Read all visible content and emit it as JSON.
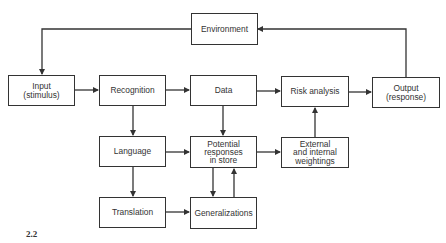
{
  "diagram": {
    "figure_label": "2.2",
    "nodes": {
      "environment": "Environment",
      "input": "Input\n(stimulus)",
      "recognition": "Recognition",
      "data": "Data",
      "risk_analysis": "Risk analysis",
      "output": "Output\n(response)",
      "language": "Language",
      "potential": "Potential\nresponses\nin store",
      "weightings": "External\nand internal\nweightings",
      "translation": "Translation",
      "generalizations": "Generalizations"
    },
    "edges": [
      {
        "from": "environment",
        "to": "input"
      },
      {
        "from": "input",
        "to": "recognition"
      },
      {
        "from": "recognition",
        "to": "data"
      },
      {
        "from": "data",
        "to": "risk_analysis"
      },
      {
        "from": "risk_analysis",
        "to": "output"
      },
      {
        "from": "output",
        "to": "environment"
      },
      {
        "from": "recognition",
        "to": "language"
      },
      {
        "from": "data",
        "to": "potential"
      },
      {
        "from": "language",
        "to": "potential"
      },
      {
        "from": "potential",
        "to": "weightings"
      },
      {
        "from": "weightings",
        "to": "risk_analysis"
      },
      {
        "from": "language",
        "to": "translation"
      },
      {
        "from": "translation",
        "to": "generalizations"
      },
      {
        "from": "potential",
        "to": "generalizations"
      },
      {
        "from": "generalizations",
        "to": "potential"
      }
    ]
  }
}
